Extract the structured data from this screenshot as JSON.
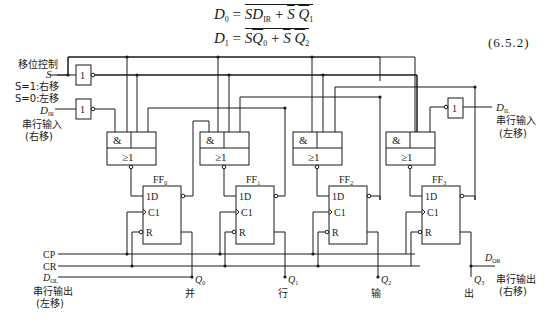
{
  "equations": {
    "d0": {
      "lhs": "D",
      "lhs_sub": "0",
      "rhs": "SD_IR + S̄ Q̄1",
      "display_rhs": "SD",
      "rhs_sub": "IR",
      "term2": "+ S̄ Q̄",
      "term2_sub": "1"
    },
    "d1": {
      "lhs": "D",
      "lhs_sub": "1",
      "rhs": "SQ̄0 + S̄ Q̄2",
      "display_rhs": "SQ̄",
      "rhs_sub": "0",
      "term2": "+ S̄ Q̄",
      "term2_sub": "2"
    },
    "number": "(6.5.2)"
  },
  "inputs": {
    "shift_control": "移位控制",
    "s_label": "S",
    "s_right": "S=1:右移",
    "s_left": "S=0:左移",
    "dir_label": "D",
    "dir_sub": "IR",
    "serial_in_right": "串行输入",
    "serial_in_right_paren": "(右移)",
    "dil_label": "D",
    "dil_sub": "IL",
    "serial_in_left": "串行输入",
    "serial_in_left_paren": "(左移)"
  },
  "gates": {
    "not_label": "1",
    "and_label": "&",
    "or_label": "≥1"
  },
  "flipflops": [
    {
      "name": "FF",
      "sub": "0",
      "q": "Q",
      "q_sub": "0",
      "char": "并"
    },
    {
      "name": "FF",
      "sub": "1",
      "q": "Q",
      "q_sub": "1",
      "char": "行"
    },
    {
      "name": "FF",
      "sub": "2",
      "q": "Q",
      "q_sub": "2",
      "char": "输"
    },
    {
      "name": "FF",
      "sub": "3",
      "q": "Q",
      "q_sub": "3",
      "char": "出"
    }
  ],
  "ff_pins": {
    "d": "1D",
    "c": "C1",
    "r": "R"
  },
  "bus": {
    "cp": "CP",
    "cr": "CR",
    "dol": "D",
    "dol_sub": "OL",
    "serial_out_left": "串行输出",
    "serial_out_left_paren": "(左移)",
    "dor": "D",
    "dor_sub": "OR",
    "serial_out_right": "串行输出",
    "serial_out_right_paren": "(右移)"
  }
}
